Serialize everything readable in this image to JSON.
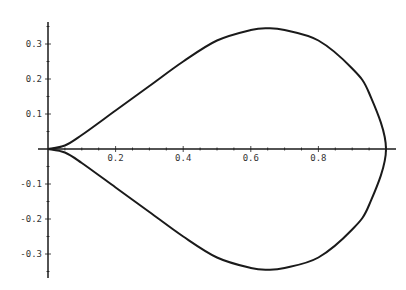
{
  "chart_data": {
    "type": "line",
    "title": "",
    "xlabel": "",
    "ylabel": "",
    "xlim": [
      0,
      1.02
    ],
    "ylim": [
      -0.36,
      0.36
    ],
    "grid": false,
    "legend": null,
    "x_ticks": [
      "0.2",
      "0.4",
      "0.6",
      "0.8"
    ],
    "y_ticks": [
      "0.3",
      "0.2",
      "0.1",
      "-0.1",
      "-0.2",
      "-0.3"
    ],
    "series": [
      {
        "name": "upper branch",
        "x": [
          0,
          0.05,
          0.1,
          0.2,
          0.3,
          0.4,
          0.5,
          0.6,
          0.65,
          0.7,
          0.8,
          0.9,
          0.95,
          1.0
        ],
        "y": [
          0,
          0.01,
          0.04,
          0.11,
          0.18,
          0.25,
          0.31,
          0.34,
          0.345,
          0.34,
          0.31,
          0.23,
          0.16,
          0
        ]
      },
      {
        "name": "lower branch",
        "x": [
          0,
          0.05,
          0.1,
          0.2,
          0.3,
          0.4,
          0.5,
          0.6,
          0.65,
          0.7,
          0.8,
          0.9,
          0.95,
          1.0
        ],
        "y": [
          0,
          -0.01,
          -0.04,
          -0.11,
          -0.18,
          -0.25,
          -0.31,
          -0.34,
          -0.345,
          -0.34,
          -0.31,
          -0.23,
          -0.16,
          0
        ]
      }
    ]
  }
}
